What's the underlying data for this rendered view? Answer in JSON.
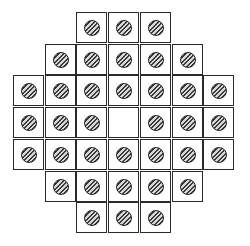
{
  "game": {
    "name": "peg-solitaire",
    "board_type": "french-37",
    "colors": {
      "line": "#2a2a2a",
      "peg": "#3a3a3a",
      "background": "#ffffff"
    },
    "rows": [
      {
        "start_col": 2,
        "cells": [
          1,
          1,
          1
        ]
      },
      {
        "start_col": 1,
        "cells": [
          1,
          1,
          1,
          1,
          1
        ]
      },
      {
        "start_col": 0,
        "cells": [
          1,
          1,
          1,
          1,
          1,
          1,
          1
        ]
      },
      {
        "start_col": 0,
        "cells": [
          1,
          1,
          1,
          0,
          1,
          1,
          1
        ]
      },
      {
        "start_col": 0,
        "cells": [
          1,
          1,
          1,
          1,
          1,
          1,
          1
        ]
      },
      {
        "start_col": 1,
        "cells": [
          1,
          1,
          1,
          1,
          1
        ]
      },
      {
        "start_col": 2,
        "cells": [
          1,
          1,
          1
        ]
      }
    ],
    "peg_count": 36,
    "empty_holes": [
      {
        "row": 3,
        "col": 3
      }
    ]
  }
}
